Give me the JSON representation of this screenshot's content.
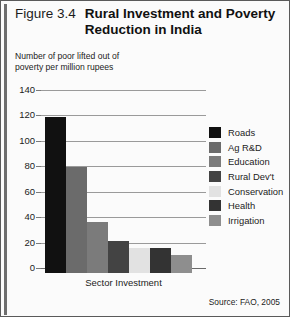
{
  "figure": {
    "number": "Figure 3.4",
    "title_lines": [
      "Rural Investment and Poverty",
      "Reduction in India"
    ],
    "source": "Source: FAO, 2005"
  },
  "chart_data": {
    "type": "bar",
    "title": "Rural Investment and Poverty Reduction in India",
    "subtitle": "",
    "xlabel": "Sector Investment",
    "ylabel_lines": [
      "Number of poor lifted out of",
      "poverty per million rupees"
    ],
    "ylabel": "Number of poor lifted out of poverty per million rupees",
    "categories": [
      "Roads",
      "Ag R&D",
      "Education",
      "Rural Dev't",
      "Conservation",
      "Health",
      "Irrigation"
    ],
    "values": [
      123,
      83,
      40,
      25,
      20,
      20,
      14
    ],
    "colors": [
      "#111111",
      "#6b6b6b",
      "#7b7b7b",
      "#434343",
      "#e2e2e2",
      "#333333",
      "#8e8e8e"
    ],
    "ylim": [
      0,
      140
    ],
    "yticks": [
      140,
      120,
      100,
      80,
      60,
      40,
      20,
      0
    ],
    "grid": true,
    "legend_position": "right",
    "legend": [
      "Roads",
      "Ag R&D",
      "Education",
      "Rural Dev't",
      "Conservation",
      "Health",
      "Irrigation"
    ],
    "source": "Source: FAO, 2005"
  }
}
